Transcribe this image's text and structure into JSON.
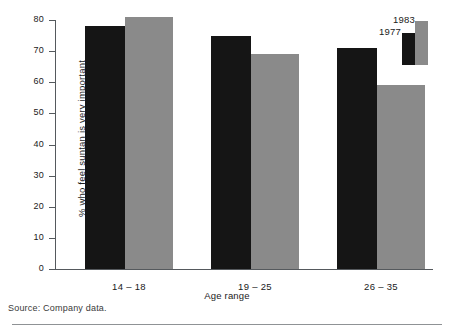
{
  "chart_data": {
    "type": "bar",
    "title": "",
    "subtitle": "",
    "xlabel": "Age range",
    "ylabel": "% who feel suntan is very important",
    "categories": [
      "14 – 18",
      "19 – 25",
      "26 – 35"
    ],
    "series": [
      {
        "name": "1977",
        "color": "#151515",
        "values": [
          78,
          75,
          71
        ]
      },
      {
        "name": "1983",
        "color": "#8a8a8a",
        "values": [
          81,
          69,
          59
        ]
      }
    ],
    "ylim": [
      0,
      80
    ],
    "ytick_labels": [
      "80",
      "70",
      "60",
      "50",
      "40",
      "30",
      "20",
      "10",
      "0"
    ],
    "ytick_values": [
      80,
      70,
      60,
      50,
      40,
      30,
      20,
      10,
      0
    ],
    "grid": false,
    "legend_position": "top-right",
    "annotations": []
  },
  "footer": {
    "source_note": "Source: Company data."
  },
  "legend": {
    "label_a": "1977",
    "label_b": "1983"
  }
}
